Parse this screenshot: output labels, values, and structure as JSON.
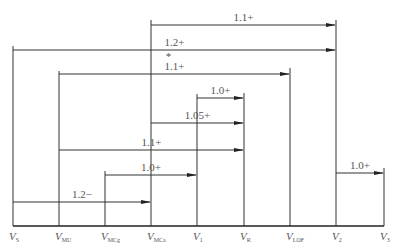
{
  "diagram": {
    "type": "speed-relationship-diagram",
    "baseline_y": 226,
    "speeds": [
      {
        "id": "vs",
        "symbol": "V",
        "sub": "S",
        "x": 13,
        "top": 46
      },
      {
        "id": "vmu",
        "symbol": "V",
        "sub": "MU",
        "x": 59,
        "top": 71
      },
      {
        "id": "vmcg",
        "symbol": "V",
        "sub": "MCg",
        "x": 105,
        "top": 171
      },
      {
        "id": "vmca",
        "symbol": "V",
        "sub": "MCa",
        "x": 151,
        "top": 20
      },
      {
        "id": "v1",
        "symbol": "V",
        "sub": "1",
        "x": 197,
        "top": 94
      },
      {
        "id": "vr",
        "symbol": "V",
        "sub": "R",
        "x": 244,
        "top": 93
      },
      {
        "id": "vlof",
        "symbol": "V",
        "sub": "LOF",
        "x": 290,
        "top": 68
      },
      {
        "id": "v2",
        "symbol": "V",
        "sub": "2",
        "x": 336,
        "top": 20
      },
      {
        "id": "v3",
        "symbol": "V",
        "sub": "3",
        "x": 384,
        "top": 168
      }
    ],
    "arrows": [
      {
        "from": "vmca",
        "to": "v2",
        "y": 25,
        "label": "1.1+",
        "note": ""
      },
      {
        "from": "vs",
        "to": "v2",
        "y": 50,
        "label": "1.2+",
        "note": ""
      },
      {
        "from": "vmu",
        "to": "vlof",
        "y": 74,
        "label": "1.1+",
        "note": "*"
      },
      {
        "from": "v1",
        "to": "vr",
        "y": 98,
        "label": "1.0+",
        "note": ""
      },
      {
        "from": "vmca",
        "to": "vr",
        "y": 123,
        "label": "1.05+",
        "note": ""
      },
      {
        "from": "vmu",
        "to": "vr",
        "y": 150,
        "label": "1.1+",
        "note": ""
      },
      {
        "from": "vmcg",
        "to": "v1",
        "y": 175,
        "label": "1.0+",
        "note": ""
      },
      {
        "from": "v2",
        "to": "v3",
        "y": 173,
        "label": "1.0+",
        "note": ""
      },
      {
        "from": "vs",
        "to": "vmca",
        "y": 202,
        "label": "1.2−",
        "note": ""
      }
    ]
  }
}
